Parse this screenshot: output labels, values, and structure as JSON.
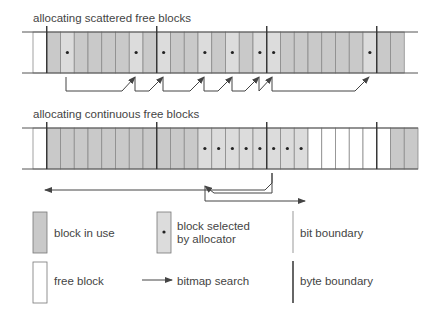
{
  "diagram1": {
    "title": "allocating scattered free blocks",
    "lead_block": "free",
    "blocks": [
      "use",
      "sel",
      "use",
      "use",
      "use",
      "use",
      "sel",
      "use",
      "sel",
      "use",
      "use",
      "sel",
      "use",
      "sel",
      "use",
      "sel",
      "sel",
      "use",
      "use",
      "use",
      "use",
      "use",
      "use",
      "sel"
    ],
    "tail_blocks": [
      "use",
      "use"
    ]
  },
  "diagram2": {
    "title": "allocating continuous free blocks",
    "lead_block": "free",
    "blocks": [
      "use",
      "use",
      "use",
      "use",
      "use",
      "use",
      "use",
      "use",
      "use",
      "use",
      "use",
      "sel",
      "sel",
      "sel",
      "sel",
      "sel",
      "sel",
      "sel",
      "sel",
      "free",
      "free",
      "free",
      "free",
      "free"
    ],
    "tail_blocks": [
      "free",
      "use",
      "use"
    ]
  },
  "colors": {
    "in_use": "#c9c9c9",
    "selected": "#dcdcdc",
    "free": "#ffffff",
    "bit_line": "#8a8a8a",
    "byte_line": "#333333",
    "arrow": "#444444"
  },
  "legend": {
    "block_in_use": "block in use",
    "block_selected_line1": "block selected",
    "block_selected_line2": "by allocator",
    "bit_boundary": "bit boundary",
    "free_block": "free block",
    "bitmap_search": "bitmap search",
    "byte_boundary": "byte boundary"
  }
}
